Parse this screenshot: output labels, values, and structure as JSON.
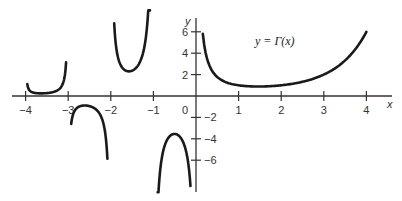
{
  "chart_data": {
    "type": "line",
    "title": "y = Γ(x)",
    "xlabel": "x",
    "ylabel": "y",
    "xlim": [
      -4.3,
      4.9
    ],
    "ylim": [
      -9.5,
      8.5
    ],
    "grid": false,
    "x_ticks": [
      {
        "value": -4,
        "label": "−4"
      },
      {
        "value": -3,
        "label": "−3"
      },
      {
        "value": -2,
        "label": "−2"
      },
      {
        "value": -1,
        "label": "−1"
      },
      {
        "value": 0,
        "label": "0"
      },
      {
        "value": 1,
        "label": "1"
      },
      {
        "value": 2,
        "label": "2"
      },
      {
        "value": 3,
        "label": "3"
      },
      {
        "value": 4,
        "label": "4"
      }
    ],
    "y_ticks": [
      {
        "value": 6,
        "label": "6"
      },
      {
        "value": 4,
        "label": "4"
      },
      {
        "value": 2,
        "label": "2"
      },
      {
        "value": -2,
        "label": "−2"
      },
      {
        "value": -4,
        "label": "−4"
      },
      {
        "value": -6,
        "label": "−6"
      }
    ],
    "series": [
      {
        "name": "branch (-4,-3)",
        "domain": [
          -3.96,
          -3.05
        ]
      },
      {
        "name": "branch (-3,-2)",
        "domain": [
          -2.93,
          -2.08
        ]
      },
      {
        "name": "branch (-2,-1)",
        "domain": [
          -1.92,
          -1.08
        ]
      },
      {
        "name": "branch (-1,0)",
        "domain": [
          -0.9,
          -0.13
        ]
      },
      {
        "name": "branch (0,4)",
        "domain": [
          0.16,
          4.0
        ]
      }
    ],
    "annotation": "y = Γ(x)"
  }
}
